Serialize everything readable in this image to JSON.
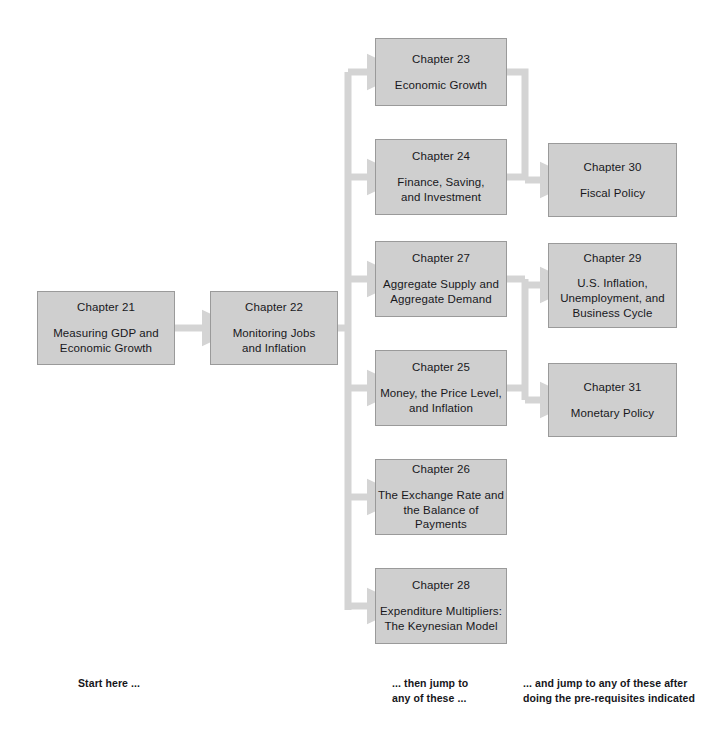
{
  "diagram": {
    "colors": {
      "node_fill": "#cfcfcf",
      "node_border": "#9a9a9a",
      "arrow": "#d4d4d4",
      "text": "#18181c",
      "background": "#ffffff"
    },
    "columns": [
      {
        "name": "start",
        "caption_ref": 0
      },
      {
        "name": "core",
        "caption_ref": 1
      },
      {
        "name": "policy",
        "caption_ref": 2
      }
    ],
    "nodes": [
      {
        "id": "ch21",
        "chapter": "Chapter 21",
        "title": "Measuring GDP and\nEconomic Growth",
        "column": "start",
        "x": 37,
        "y": 291,
        "w": 138,
        "h": 74
      },
      {
        "id": "ch22",
        "chapter": "Chapter 22",
        "title": "Monitoring Jobs\nand Inflation",
        "column": "start",
        "x": 210,
        "y": 291,
        "w": 128,
        "h": 74
      },
      {
        "id": "ch23",
        "chapter": "Chapter 23",
        "title": "Economic Growth",
        "column": "core",
        "x": 375,
        "y": 38,
        "w": 132,
        "h": 68
      },
      {
        "id": "ch24",
        "chapter": "Chapter 24",
        "title": "Finance, Saving,\nand Investment",
        "column": "core",
        "x": 375,
        "y": 139,
        "w": 132,
        "h": 76
      },
      {
        "id": "ch27",
        "chapter": "Chapter 27",
        "title": "Aggregate Supply and\nAggregate Demand",
        "column": "core",
        "x": 375,
        "y": 241,
        "w": 132,
        "h": 76
      },
      {
        "id": "ch25",
        "chapter": "Chapter 25",
        "title": "Money, the Price Level,\nand Inflation",
        "column": "core",
        "x": 375,
        "y": 350,
        "w": 132,
        "h": 76
      },
      {
        "id": "ch26",
        "chapter": "Chapter 26",
        "title": "The Exchange Rate and\nthe Balance of Payments",
        "column": "core",
        "x": 375,
        "y": 459,
        "w": 132,
        "h": 76
      },
      {
        "id": "ch28",
        "chapter": "Chapter 28",
        "title": "Expenditure Multipliers:\nThe Keynesian Model",
        "column": "core",
        "x": 375,
        "y": 568,
        "w": 132,
        "h": 76
      },
      {
        "id": "ch30",
        "chapter": "Chapter 30",
        "title": "Fiscal Policy",
        "column": "policy",
        "x": 548,
        "y": 143,
        "w": 129,
        "h": 74
      },
      {
        "id": "ch29",
        "chapter": "Chapter 29",
        "title": "U.S. Inflation,\nUnemployment, and\nBusiness Cycle",
        "column": "policy",
        "x": 548,
        "y": 243,
        "w": 129,
        "h": 85
      },
      {
        "id": "ch31",
        "chapter": "Chapter 31",
        "title": "Monetary Policy",
        "column": "policy",
        "x": 548,
        "y": 363,
        "w": 129,
        "h": 74
      }
    ],
    "edges": [
      {
        "from": "ch21",
        "to": "ch22",
        "kind": "straight"
      },
      {
        "from": "ch22",
        "to": "ch23",
        "kind": "branch"
      },
      {
        "from": "ch22",
        "to": "ch24",
        "kind": "branch"
      },
      {
        "from": "ch22",
        "to": "ch27",
        "kind": "branch"
      },
      {
        "from": "ch22",
        "to": "ch25",
        "kind": "branch"
      },
      {
        "from": "ch22",
        "to": "ch26",
        "kind": "branch"
      },
      {
        "from": "ch22",
        "to": "ch28",
        "kind": "branch"
      },
      {
        "from": "ch23",
        "to": "ch30",
        "kind": "elbow"
      },
      {
        "from": "ch24",
        "to": "ch30",
        "kind": "elbow"
      },
      {
        "from": "ch27",
        "to": "ch29",
        "kind": "elbow"
      },
      {
        "from": "ch27",
        "to": "ch31",
        "kind": "elbow"
      },
      {
        "from": "ch25",
        "to": "ch29",
        "kind": "elbow"
      },
      {
        "from": "ch25",
        "to": "ch31",
        "kind": "elbow"
      }
    ],
    "captions": [
      {
        "text": "Start here ...",
        "x": 78,
        "y": 676
      },
      {
        "text": "... then jump to\nany of these ...",
        "x": 392,
        "y": 676
      },
      {
        "text": "... and jump to any of these after\ndoing the pre-requisites indicated",
        "x": 523,
        "y": 676
      }
    ]
  }
}
